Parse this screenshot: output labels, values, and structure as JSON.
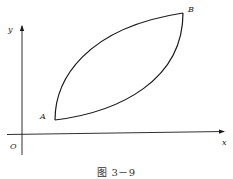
{
  "figure": {
    "caption": "图 3－9",
    "axes": {
      "x_label": "x",
      "y_label": "y",
      "origin_label": "O"
    },
    "points": [
      {
        "name": "A",
        "label": "A"
      },
      {
        "name": "B",
        "label": "B"
      }
    ],
    "colors": {
      "stroke": "#1a1a1a",
      "background": "#ffffff"
    }
  }
}
